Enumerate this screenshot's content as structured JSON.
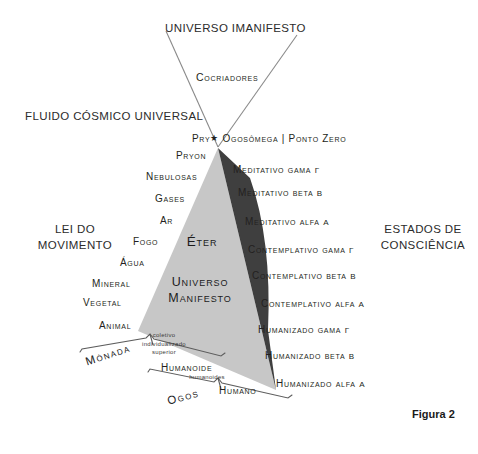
{
  "figure": {
    "caption": "Figura 2"
  },
  "headings": {
    "top": "UNIVERSO IMANIFESTO",
    "left_upper": "FLUIDO CÓSMICO UNIVERSAL",
    "left_mid_line1": "LEI DO",
    "left_mid_line2": "MOVIMENTO",
    "right_mid_line1": "ESTADOS DE",
    "right_mid_line2": "CONSCIÊNCIA"
  },
  "apex": {
    "cocriadores": "Cocriadores",
    "pry": "Pry",
    "star_icon": "★",
    "ogosomega": "Ogosômega | Ponto Zero"
  },
  "inner": {
    "eter": "Éter",
    "universo_line1": "Universo",
    "universo_line2": "Manifesto"
  },
  "left_tiers": [
    {
      "label": "Pryon"
    },
    {
      "label": "Nebulosas"
    },
    {
      "label": "Gases"
    },
    {
      "label": "Ar"
    },
    {
      "label": "Fogo"
    },
    {
      "label": "Água"
    },
    {
      "label": "Mineral"
    },
    {
      "label": "Vegetal"
    },
    {
      "label": "Animal"
    }
  ],
  "left_sub": {
    "animal_sub_line1": "coletivo",
    "animal_sub_line2": "individualizado",
    "animal_sub_line3": "superior",
    "humanoide": "Humanoide",
    "humanoide_sub": "humanoides",
    "humano": "Humano"
  },
  "braces": {
    "monada": "Mónada",
    "ogos": "Ogos"
  },
  "right_states": [
    {
      "name": "Meditativo",
      "band": "gama",
      "greek": "γ"
    },
    {
      "name": "Meditativo",
      "band": "beta",
      "greek": "β"
    },
    {
      "name": "Meditativo",
      "band": "alfa",
      "greek": "α"
    },
    {
      "name": "Contemplativo",
      "band": "gama",
      "greek": "γ"
    },
    {
      "name": "Contemplativo",
      "band": "beta",
      "greek": "β"
    },
    {
      "name": "Contemplativo",
      "band": "alfa",
      "greek": "α"
    },
    {
      "name": "Humanizado",
      "band": "gama",
      "greek": "γ"
    },
    {
      "name": "Humanizado",
      "band": "beta",
      "greek": "β"
    },
    {
      "name": "Humanizado",
      "band": "alfa",
      "greek": "α"
    }
  ],
  "colors": {
    "background": "#ffffff",
    "light_triangle": "#c9c9c9",
    "dark_triangle": "#3d3d3d",
    "line": "#6f6f6f",
    "text": "#231f20"
  }
}
